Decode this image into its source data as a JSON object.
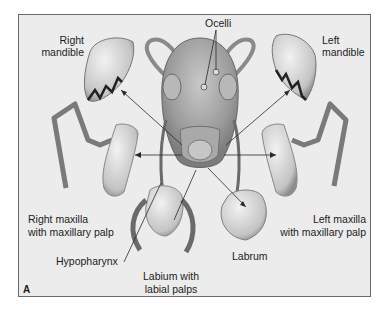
{
  "figure": {
    "panel_letter": "A",
    "labels": {
      "ocelli": "Ocelli",
      "right_mandible_1": "Right",
      "right_mandible_2": "mandible",
      "left_mandible_1": "Left",
      "left_mandible_2": "mandible",
      "right_maxilla_1": "Right maxilla",
      "right_maxilla_2": "with maxillary palp",
      "left_maxilla_1": "Left maxilla",
      "left_maxilla_2": "with maxillary palp",
      "hypopharynx": "Hypopharynx",
      "labium_1": "Labium with",
      "labium_2": "labial palps",
      "labrum": "Labrum"
    },
    "colors": {
      "background": "#ececec",
      "frame": "#6a6a6a",
      "text": "#1c1c1c",
      "leader_line": "#2a2a2a"
    }
  }
}
